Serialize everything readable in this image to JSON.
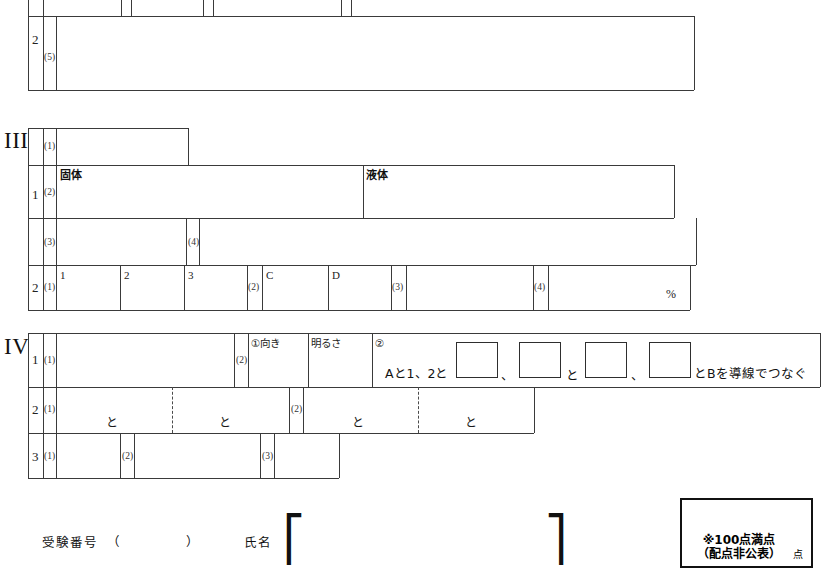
{
  "document": {
    "kind": "answer-sheet",
    "language": "ja"
  },
  "sections": {
    "top_partial": {
      "group_number": "2",
      "question_number": "(5)"
    },
    "section3": {
      "roman": "III",
      "group1": {
        "number": "1",
        "items": [
          {
            "number": "(1)"
          },
          {
            "number": "(2)",
            "label_left": "固体",
            "label_right": "液体"
          },
          {
            "number": "(3)"
          },
          {
            "number": "(4)"
          }
        ]
      },
      "group2": {
        "number": "2",
        "items": [
          {
            "number": "(1)",
            "columns": [
              "1",
              "2",
              "3"
            ]
          },
          {
            "number": "(2)",
            "columns": [
              "C",
              "D"
            ]
          },
          {
            "number": "(3)"
          },
          {
            "number": "(4)",
            "unit": "%"
          }
        ]
      }
    },
    "section4": {
      "roman": "IV",
      "group1": {
        "number": "1",
        "items": [
          {
            "number": "(1)"
          },
          {
            "number": "(2)",
            "sub1_label": "①向き",
            "sub1_label2": "明るさ",
            "sub2_marker": "②",
            "sentence_start": "Aと1、2と",
            "sep1": "、",
            "mid": "と",
            "sep2": "、",
            "sentence_end": "とBを導線でつなぐ",
            "blank_count": 4
          }
        ]
      },
      "group2": {
        "number": "2",
        "items": [
          {
            "number": "(1)",
            "connector_a": "と",
            "connector_b": "と"
          },
          {
            "number": "(2)",
            "connector_a": "と",
            "connector_b": "と"
          }
        ]
      },
      "group3": {
        "number": "3",
        "items": [
          {
            "number": "(1)"
          },
          {
            "number": "(2)"
          },
          {
            "number": "(3)"
          }
        ]
      }
    }
  },
  "footer": {
    "exam_number_label": "受験番号",
    "exam_number_open": "（",
    "exam_number_close": "）",
    "name_label": "氏名",
    "name_bracket_open": "⎡",
    "name_bracket_close": "⎤"
  },
  "score_box": {
    "line1": "※100点満点",
    "line2": "（配点非公表）",
    "unit": "点"
  },
  "colors": {
    "ink": "#1a1a1a",
    "rule": "#3a3a3a",
    "paper": "#ffffff",
    "score_border": "#111111"
  }
}
